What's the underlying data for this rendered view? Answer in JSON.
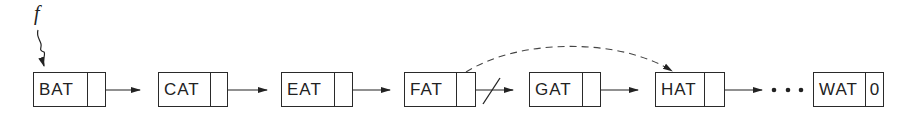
{
  "diagram": {
    "type": "singly-linked-list-deletion",
    "pointer_label": "f",
    "nodes": [
      {
        "data": "BAT",
        "link": ""
      },
      {
        "data": "CAT",
        "link": ""
      },
      {
        "data": "EAT",
        "link": ""
      },
      {
        "data": "FAT",
        "link": ""
      },
      {
        "data": "GAT",
        "link": ""
      },
      {
        "data": "HAT",
        "link": ""
      },
      {
        "data": "WAT",
        "link": "0"
      }
    ],
    "ellipsis": "• • •",
    "annotations": {
      "removed_link": "FAT → GAT (struck through)",
      "new_link": "FAT → HAT (dashed arc)"
    }
  }
}
